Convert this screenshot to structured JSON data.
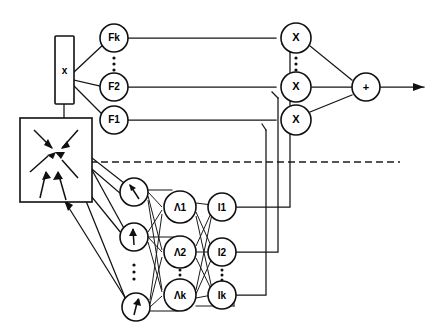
{
  "diagram": {
    "background_color": "#ffffff",
    "line_color": "#101010",
    "input_box": {
      "label": "x",
      "name": "input-vector-box"
    },
    "environment_box": {
      "label": "",
      "name": "environment-block",
      "arrow_count": 6
    },
    "membership_nodes": [
      {
        "label": "Fk",
        "cy": 38
      },
      {
        "label": "F2",
        "cy": 87
      },
      {
        "label": "F1",
        "cy": 120
      }
    ],
    "membership_ellipsis": {
      "visible": true,
      "between": "Fk-F2"
    },
    "sensor_nodes": [
      {
        "label": "",
        "icon": "arrow-up-left-icon",
        "cy": 192
      },
      {
        "label": "",
        "icon": "arrow-up-icon",
        "cy": 237
      },
      {
        "label": "",
        "icon": "arrow-up-right-icon",
        "cy": 307
      }
    ],
    "sensor_ellipsis": {
      "visible": true,
      "between": "sensor2-sensor3"
    },
    "rule_nodes": [
      {
        "label": "Λ1",
        "cy": 207
      },
      {
        "label": "Λ2",
        "cy": 252
      },
      {
        "label": "Λk",
        "cy": 295
      }
    ],
    "rule_ellipsis": {
      "visible": true,
      "between": "L2-Lk"
    },
    "inference_nodes": [
      {
        "label": "I1",
        "cy": 207
      },
      {
        "label": "I2",
        "cy": 252
      },
      {
        "label": "Ik",
        "cy": 295
      }
    ],
    "inference_ellipsis": {
      "visible": true,
      "between": "I2-Ik"
    },
    "multiplier_nodes": [
      {
        "label": "X",
        "cy": 38
      },
      {
        "label": "X",
        "cy": 87
      },
      {
        "label": "X",
        "cy": 120
      }
    ],
    "multiplier_ellipsis": {
      "visible": true,
      "between": "X1-X2"
    },
    "summation_node": {
      "label": "+",
      "name": "summation-node"
    },
    "output": {
      "label": "",
      "name": "output-arrow"
    },
    "divider": {
      "style": "dashed",
      "name": "layer-divider"
    }
  }
}
